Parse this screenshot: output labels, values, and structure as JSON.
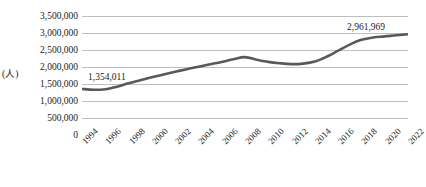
{
  "chart_data": {
    "type": "line",
    "title": "",
    "subtitle": "",
    "xlabel": "",
    "ylabel": "(人)",
    "ylim": [
      0,
      3500000
    ],
    "ytick_step": 500000,
    "grid": true,
    "legend": false,
    "legend_position": "none",
    "line_color": "#595959",
    "grid_color": "#bfbfbf",
    "text_color": "#1a1a1a",
    "background": "#ffffff",
    "ytick_labels": [
      "3,500,000",
      "3,000,000",
      "2,500,000",
      "2,000,000",
      "1,500,000",
      "1,000,000",
      "500,000",
      "0"
    ],
    "categories": [
      "1994",
      "1995",
      "1996",
      "1997",
      "1998",
      "1999",
      "2000",
      "2001",
      "2002",
      "2003",
      "2004",
      "2005",
      "2006",
      "2007",
      "2008",
      "2009",
      "2010",
      "2011",
      "2012",
      "2013",
      "2014",
      "2015",
      "2016",
      "2017",
      "2018",
      "2019",
      "2020",
      "2021",
      "2022"
    ],
    "xtick_labels": [
      "1994",
      "1996",
      "1998",
      "2000",
      "2002",
      "2004",
      "2006",
      "2008",
      "2010",
      "2012",
      "2014",
      "2016",
      "2018",
      "2020",
      "2022"
    ],
    "values": [
      1354011,
      1330000,
      1345000,
      1420000,
      1520000,
      1610000,
      1700000,
      1780000,
      1860000,
      1935000,
      2010000,
      2080000,
      2150000,
      2230000,
      2290000,
      2215000,
      2150000,
      2110000,
      2085000,
      2100000,
      2160000,
      2300000,
      2480000,
      2660000,
      2800000,
      2870000,
      2900000,
      2935000,
      2961969
    ],
    "annotations": [
      {
        "label": "1,354,011",
        "category": "1994",
        "value": 1354011
      },
      {
        "label": "2,961,969",
        "category": "2022",
        "value": 2961969
      }
    ]
  }
}
